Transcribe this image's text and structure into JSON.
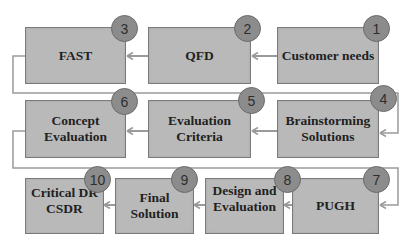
{
  "diagram": {
    "type": "process-flow",
    "colors": {
      "box_fill": "#b9b9b9",
      "box_border": "#7a7a7a",
      "badge_fill": "#8c8c8c",
      "connector": "#9a9a9a",
      "text": "#222222"
    },
    "steps": [
      {
        "number": "1",
        "label": "Customer needs"
      },
      {
        "number": "2",
        "label": "QFD"
      },
      {
        "number": "3",
        "label": "FAST"
      },
      {
        "number": "4",
        "label": "Brainstorming\nSolutions"
      },
      {
        "number": "5",
        "label": "Evaluation\nCriteria"
      },
      {
        "number": "6",
        "label": "Concept\nEvaluation"
      },
      {
        "number": "7",
        "label": "PUGH"
      },
      {
        "number": "8",
        "label": "Design and\nEvaluation"
      },
      {
        "number": "9",
        "label": "Final\nSolution"
      },
      {
        "number": "10",
        "label": "Critical DR\nCSDR"
      }
    ],
    "flow": [
      [
        "1",
        "2"
      ],
      [
        "2",
        "3"
      ],
      [
        "3",
        "4"
      ],
      [
        "4",
        "5"
      ],
      [
        "5",
        "6"
      ],
      [
        "6",
        "7"
      ],
      [
        "7",
        "8"
      ],
      [
        "8",
        "9"
      ],
      [
        "9",
        "10"
      ]
    ]
  }
}
